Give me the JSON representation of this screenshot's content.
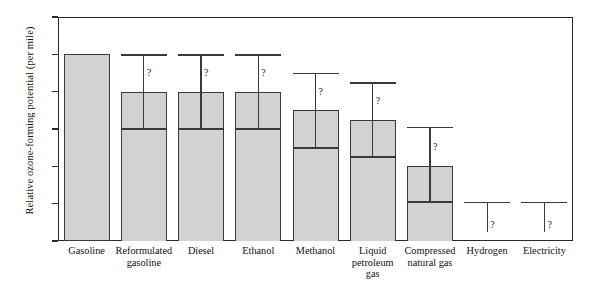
{
  "chart_data": {
    "type": "bar",
    "title": "",
    "subtitle": "",
    "xlabel": "",
    "ylabel": "Relative ozone-forming potential (per mile)",
    "ylim": [
      0,
      1.2
    ],
    "yticks": [
      "0",
      "0.2",
      "0.4",
      "0.6",
      "0.8",
      "1.0",
      "1.2"
    ],
    "ytick_values": [
      0,
      0.2,
      0.4,
      0.6,
      0.8,
      1.0,
      1.2
    ],
    "grid": false,
    "legend": "none",
    "uncertainty_marker": "?",
    "categories": [
      "Gasoline",
      "Reformulated gasoline",
      "Diesel",
      "Ethanol",
      "Methanol",
      "Liquid petroleum gas",
      "Compressed natural gas",
      "Hydrogen",
      "Electricity"
    ],
    "category_lines": [
      [
        "Gasoline"
      ],
      [
        "Reformulated",
        "gasoline"
      ],
      [
        "Diesel"
      ],
      [
        "Ethanol"
      ],
      [
        "Methanol"
      ],
      [
        "Liquid",
        "petroleum",
        "gas"
      ],
      [
        "Compressed",
        "natural gas"
      ],
      [
        "Hydrogen"
      ],
      [
        "Electricity"
      ]
    ],
    "series": [
      {
        "name": "low estimate",
        "values": [
          1.0,
          0.6,
          0.6,
          0.6,
          0.5,
          0.45,
          0.21,
          0.21,
          0.21
        ]
      },
      {
        "name": "central estimate",
        "values": [
          1.0,
          0.8,
          0.8,
          0.8,
          0.7,
          0.65,
          0.4,
          0.21,
          0.21
        ]
      },
      {
        "name": "high estimate",
        "values": [
          1.0,
          1.0,
          1.0,
          1.0,
          0.9,
          0.85,
          0.61,
          0.21,
          0.21
        ]
      }
    ],
    "bars": [
      {
        "category": "Gasoline",
        "low": 0,
        "mid": 1.0,
        "high": 1.0,
        "has_box_line": false,
        "has_whisker": false,
        "has_qmark": false,
        "bar_drawn": true
      },
      {
        "category": "Reformulated gasoline",
        "low": 0.6,
        "mid": 0.8,
        "high": 1.0,
        "has_box_line": true,
        "has_whisker": true,
        "has_qmark": true,
        "bar_drawn": true
      },
      {
        "category": "Diesel",
        "low": 0.6,
        "mid": 0.8,
        "high": 1.0,
        "has_box_line": true,
        "has_whisker": true,
        "has_qmark": true,
        "bar_drawn": true
      },
      {
        "category": "Ethanol",
        "low": 0.6,
        "mid": 0.8,
        "high": 1.0,
        "has_box_line": true,
        "has_whisker": true,
        "has_qmark": true,
        "bar_drawn": true
      },
      {
        "category": "Methanol",
        "low": 0.5,
        "mid": 0.7,
        "high": 0.9,
        "has_box_line": true,
        "has_whisker": true,
        "has_qmark": true,
        "bar_drawn": true
      },
      {
        "category": "Liquid petroleum gas",
        "low": 0.45,
        "mid": 0.65,
        "high": 0.85,
        "has_box_line": true,
        "has_whisker": true,
        "has_qmark": true,
        "bar_drawn": true
      },
      {
        "category": "Compressed natural gas",
        "low": 0.21,
        "mid": 0.4,
        "high": 0.61,
        "has_box_line": true,
        "has_whisker": true,
        "has_qmark": true,
        "bar_drawn": true
      },
      {
        "category": "Hydrogen",
        "low": 0.21,
        "mid": 0.21,
        "high": 0.21,
        "has_box_line": false,
        "has_whisker": true,
        "has_qmark": true,
        "bar_drawn": false
      },
      {
        "category": "Electricity",
        "low": 0.21,
        "mid": 0.21,
        "high": 0.21,
        "has_box_line": false,
        "has_whisker": true,
        "has_qmark": true,
        "bar_drawn": false
      }
    ],
    "colors": {
      "bar_fill": "#d2d2d2",
      "bar_stroke": "#3a3a3a",
      "axis": "#2a2a2a",
      "text": "#111111",
      "background": "#ffffff"
    }
  }
}
